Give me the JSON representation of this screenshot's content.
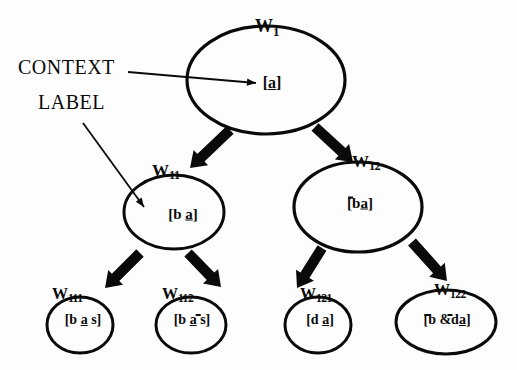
{
  "figure": {
    "type": "context-tree-diagram",
    "background": "#fdfdfd",
    "ink_color": "#0a0a0a"
  },
  "annotations": [
    {
      "id": "context",
      "text": "CONTEXT",
      "x": 18,
      "y": 56,
      "font_size": 20
    },
    {
      "id": "label",
      "text": "LABEL",
      "x": 38,
      "y": 91,
      "font_size": 20
    }
  ],
  "nodes": [
    {
      "id": "w1",
      "label_prefix": "W",
      "label_sub": "1",
      "content_open": "[",
      "content_body": "a",
      "content_close": "]",
      "content_text": "[a]",
      "label_x": 255,
      "label_y": 16,
      "cx": 266,
      "cy": 80,
      "rx": 79,
      "ry": 54,
      "content_cx": 272,
      "content_cy": 83,
      "font_size": 16
    },
    {
      "id": "w11",
      "label_prefix": "W",
      "label_sub": "11",
      "content_open": "[b ",
      "content_body": "a",
      "content_close": "]",
      "content_text": "[b a]",
      "label_x": 152,
      "label_y": 161,
      "cx": 174,
      "cy": 212,
      "rx": 50,
      "ry": 37,
      "content_cx": 183,
      "content_cy": 214,
      "font_size": 15
    },
    {
      "id": "w12",
      "label_prefix": "W",
      "label_sub": "12",
      "content_open": "[",
      "content_neg1": "b ",
      "content_body": "a",
      "content_close": "]",
      "content_text": "[~b a]",
      "label_x": 352,
      "label_y": 152,
      "cx": 358,
      "cy": 207,
      "rx": 64,
      "ry": 45,
      "content_cx": 360,
      "content_cy": 203,
      "font_size": 15
    },
    {
      "id": "w111",
      "label_prefix": "W",
      "label_sub": "111",
      "content_open": "[b ",
      "content_body": "a",
      "content_close": " s]",
      "content_text": "[b a s]",
      "label_x": 52,
      "label_y": 285,
      "cx": 80,
      "cy": 325,
      "rx": 33,
      "ry": 28,
      "content_cx": 83,
      "content_cy": 320,
      "font_size": 14
    },
    {
      "id": "w112",
      "label_prefix": "W",
      "label_sub": "112",
      "content_open": "[b ",
      "content_body": "a",
      "content_neg2": "s]",
      "content_text": "[b a ~s]",
      "label_x": 162,
      "label_y": 285,
      "cx": 191,
      "cy": 325,
      "rx": 35,
      "ry": 28,
      "content_cx": 192,
      "content_cy": 320,
      "font_size": 14
    },
    {
      "id": "w121",
      "label_prefix": "W",
      "label_sub": "121",
      "content_open": "[d ",
      "content_body": "a",
      "content_close": "]",
      "content_text": "[d a]",
      "label_x": 300,
      "label_y": 285,
      "cx": 318,
      "cy": 325,
      "rx": 33,
      "ry": 28,
      "content_cx": 320,
      "content_cy": 320,
      "font_size": 14
    },
    {
      "id": "w122",
      "label_prefix": "W",
      "label_sub": "122",
      "content_open": "[",
      "content_neg1": "b & ",
      "content_neg2b": "d ",
      "content_body": "a",
      "content_close": "]",
      "content_text": "[~b & ~d a]",
      "label_x": 434,
      "label_y": 281,
      "cx": 446,
      "cy": 322,
      "rx": 50,
      "ry": 32,
      "content_cx": 447,
      "content_cy": 320,
      "font_size": 14
    }
  ],
  "edges": [
    {
      "id": "w1-w11",
      "from": "w1",
      "to": "w11",
      "style": "block-arrow",
      "x1": 230,
      "y1": 130,
      "x2": 190,
      "y2": 168
    },
    {
      "id": "w1-w12",
      "from": "w1",
      "to": "w12",
      "style": "block-arrow",
      "x1": 315,
      "y1": 127,
      "x2": 353,
      "y2": 162
    },
    {
      "id": "w11-w111",
      "from": "w11",
      "to": "w111",
      "style": "block-arrow",
      "x1": 140,
      "y1": 253,
      "x2": 105,
      "y2": 288
    },
    {
      "id": "w11-w112",
      "from": "w11",
      "to": "w112",
      "style": "block-arrow",
      "x1": 188,
      "y1": 253,
      "x2": 221,
      "y2": 287
    },
    {
      "id": "w12-w121",
      "from": "w12",
      "to": "w121",
      "style": "block-arrow",
      "x1": 322,
      "y1": 248,
      "x2": 297,
      "y2": 288
    },
    {
      "id": "w12-w122",
      "from": "w12",
      "to": "w122",
      "style": "block-arrow",
      "x1": 412,
      "y1": 242,
      "x2": 447,
      "y2": 281
    }
  ],
  "annotation_arrows": [
    {
      "id": "context-arrow",
      "from": "context",
      "to": "w1-content",
      "x1": 128,
      "y1": 72,
      "x2": 256,
      "y2": 83
    },
    {
      "id": "label-arrow",
      "from": "label",
      "to": "w11-content",
      "x1": 83,
      "y1": 123,
      "x2": 144,
      "y2": 207
    }
  ]
}
